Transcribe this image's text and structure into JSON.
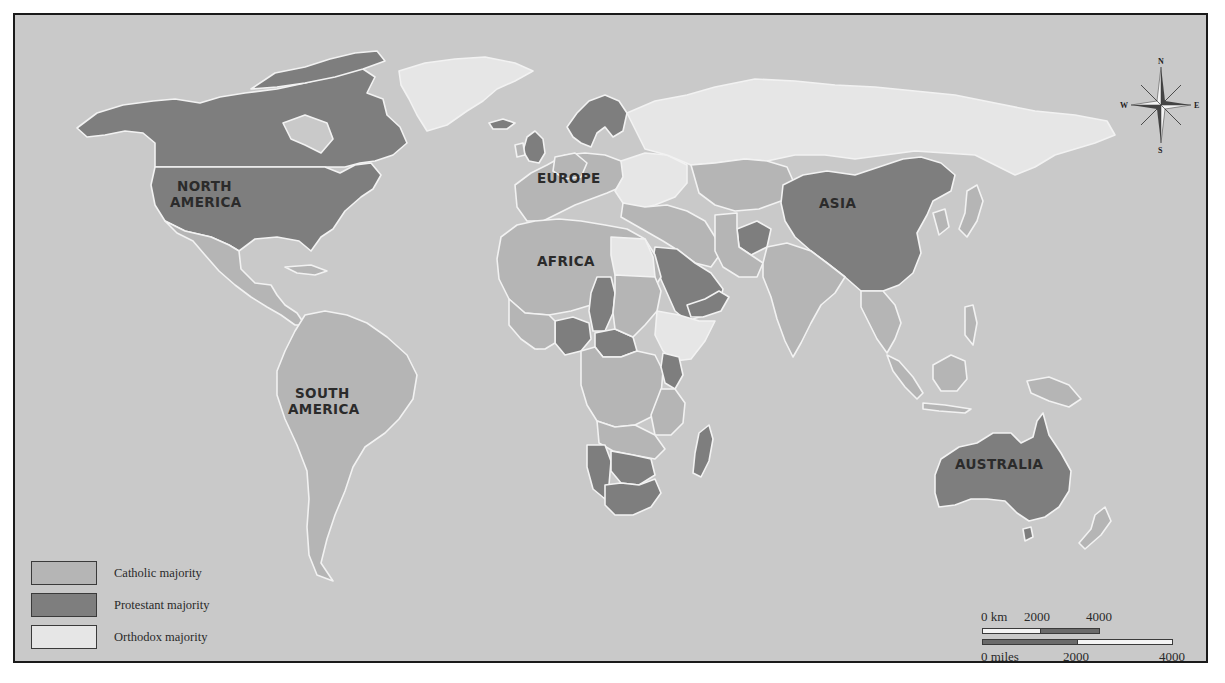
{
  "map": {
    "colors": {
      "ocean": "#c9c9c9",
      "catholic": "#b5b5b5",
      "protestant": "#7e7e7e",
      "orthodox": "#e6e6e6",
      "border": "#f2f2f2",
      "frame": "#1a1a1a",
      "text": "#2b2b2b"
    },
    "continent_labels": {
      "north_america_line1": "NORTH",
      "north_america_line2": "AMERICA",
      "south_america_line1": "SOUTH",
      "south_america_line2": "AMERICA",
      "europe": "EUROPE",
      "africa": "AFRICA",
      "asia": "ASIA",
      "australia": "AUSTRALIA"
    }
  },
  "legend": {
    "items": [
      {
        "label": "Catholic majority",
        "color": "#b5b5b5"
      },
      {
        "label": "Protestant majority",
        "color": "#7e7e7e"
      },
      {
        "label": "Orthodox majority",
        "color": "#e6e6e6"
      }
    ]
  },
  "scale_bar": {
    "km_label": "0 km",
    "km_mid": "2000",
    "km_end": "4000",
    "miles_label": "0 miles",
    "miles_mid": "2000",
    "miles_end": "4000"
  },
  "compass": {
    "north": "N",
    "south": "S",
    "east": "E",
    "west": "W"
  }
}
